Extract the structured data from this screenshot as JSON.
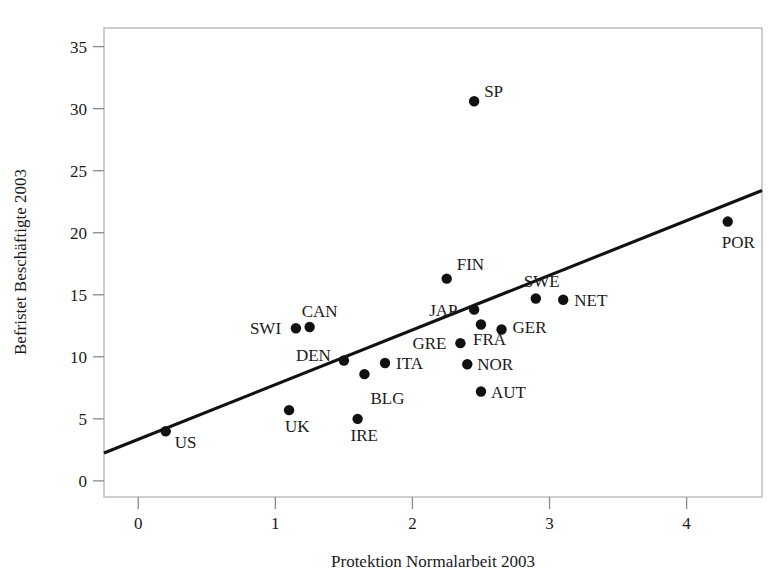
{
  "chart_data": {
    "type": "scatter",
    "title": "",
    "xlabel": "Protektion Normalarbeit 2003",
    "ylabel": "Befristet Beschäftigte 2003",
    "xlim": [
      -0.25,
      4.55
    ],
    "ylim": [
      -1.3,
      36.5
    ],
    "xticks": [
      "0",
      "1",
      "2",
      "3",
      "4"
    ],
    "xtick_values": [
      0,
      1,
      2,
      3,
      4
    ],
    "yticks": [
      "0",
      "5",
      "10",
      "15",
      "20",
      "25",
      "30",
      "35"
    ],
    "ytick_values": [
      0,
      5,
      10,
      15,
      20,
      25,
      30,
      35
    ],
    "grid": false,
    "legend": "none",
    "points": [
      {
        "label": "US",
        "x": 0.2,
        "y": 4.0,
        "label_dx": 9,
        "label_dy": 17
      },
      {
        "label": "UK",
        "x": 1.1,
        "y": 5.7,
        "label_dx": -4,
        "label_dy": 22
      },
      {
        "label": "IRE",
        "x": 1.6,
        "y": 5.0,
        "label_dx": -7,
        "label_dy": 22
      },
      {
        "label": "BLG",
        "x": 1.65,
        "y": 8.6,
        "label_dx": 6,
        "label_dy": 30
      },
      {
        "label": "AUT",
        "x": 2.5,
        "y": 7.2,
        "label_dx": 10,
        "label_dy": 6
      },
      {
        "label": "NOR",
        "x": 2.4,
        "y": 9.4,
        "label_dx": 10,
        "label_dy": 6
      },
      {
        "label": "ITA",
        "x": 1.8,
        "y": 9.5,
        "label_dx": 11,
        "label_dy": 6
      },
      {
        "label": "DEN",
        "x": 1.5,
        "y": 9.7,
        "label_dx": -48,
        "label_dy": 0
      },
      {
        "label": "GRE",
        "x": 2.35,
        "y": 11.1,
        "label_dx": -48,
        "label_dy": 6
      },
      {
        "label": "GER",
        "x": 2.65,
        "y": 12.2,
        "label_dx": 11,
        "label_dy": 3
      },
      {
        "label": "FRA",
        "x": 2.5,
        "y": 12.6,
        "label_dx": -8,
        "label_dy": 20
      },
      {
        "label": "SWI",
        "x": 1.15,
        "y": 12.3,
        "label_dx": -46,
        "label_dy": 6
      },
      {
        "label": "CAN",
        "x": 1.25,
        "y": 12.4,
        "label_dx": -8,
        "label_dy": -10
      },
      {
        "label": "JAP",
        "x": 2.45,
        "y": 13.8,
        "label_dx": -45,
        "label_dy": 6
      },
      {
        "label": "NET",
        "x": 3.1,
        "y": 14.6,
        "label_dx": 11,
        "label_dy": 6
      },
      {
        "label": "SWE",
        "x": 2.9,
        "y": 14.7,
        "label_dx": -12,
        "label_dy": -11
      },
      {
        "label": "FIN",
        "x": 2.25,
        "y": 16.3,
        "label_dx": 10,
        "label_dy": -9
      },
      {
        "label": "POR",
        "x": 4.3,
        "y": 20.9,
        "label_dx": -6,
        "label_dy": 26
      },
      {
        "label": "SP",
        "x": 2.45,
        "y": 30.6,
        "label_dx": 10,
        "label_dy": -4
      }
    ],
    "trendline": {
      "x_start": -0.25,
      "y_start": 2.25,
      "x_end": 4.55,
      "y_end": 23.4
    },
    "colors": {
      "point": "#111111",
      "line": "#111111",
      "frame": "#b9b9b9",
      "text": "#1a1a1a"
    }
  }
}
